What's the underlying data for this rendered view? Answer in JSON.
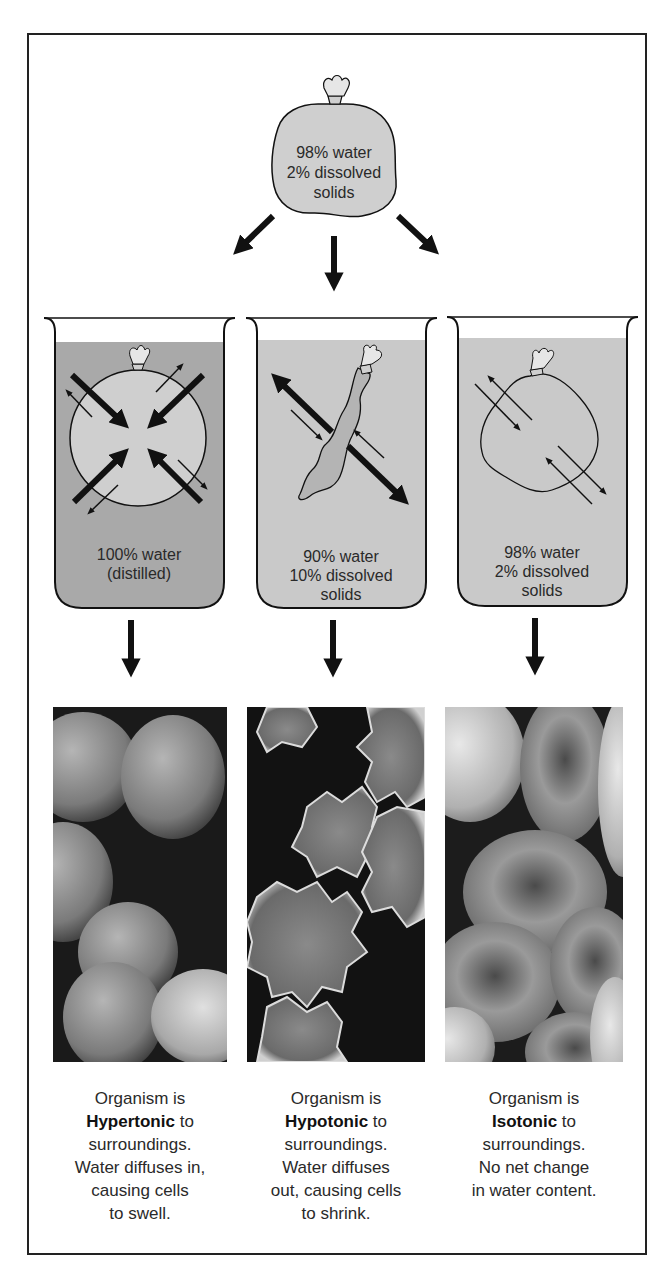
{
  "figure": {
    "source_bag": {
      "lines": [
        "98% water",
        "2% dissolved",
        "solids"
      ]
    },
    "beakers": [
      {
        "id": "hypertonic",
        "lines": [
          "100% water",
          "(distilled)"
        ],
        "fluid_color": "#a9a9a9",
        "bag_shape": "swollen-round"
      },
      {
        "id": "hypotonic",
        "lines": [
          "90% water",
          "10% dissolved",
          "solids"
        ],
        "fluid_color": "#c9c9c9",
        "bag_shape": "shrunken"
      },
      {
        "id": "isotonic",
        "lines": [
          "98% water",
          "2% dissolved",
          "solids"
        ],
        "fluid_color": "#c9c9c9",
        "bag_shape": "normal"
      }
    ],
    "photos": [
      {
        "subject": "swollen red blood cells (SEM)"
      },
      {
        "subject": "crenated shrunken red blood cells (SEM)"
      },
      {
        "subject": "normal biconcave red blood cells (SEM)"
      }
    ],
    "captions": [
      {
        "line1": "Organism is",
        "term": "Hypertonic",
        "after_term": " to",
        "rest": [
          "surroundings.",
          "Water diffuses in,",
          "causing cells",
          "to swell."
        ]
      },
      {
        "line1": "Organism is",
        "term": "Hypotonic",
        "after_term": " to",
        "rest": [
          "surroundings.",
          "Water diffuses",
          "out, causing cells",
          "to shrink."
        ]
      },
      {
        "line1": "Organism is",
        "term": "Isotonic",
        "after_term": " to",
        "rest": [
          "surroundings.",
          "No net change",
          "in water content."
        ]
      }
    ],
    "colors": {
      "line": "#111111",
      "bag_fill": "#cfcfcf",
      "fluid_dark": "#a9a9a9",
      "fluid_light": "#c9c9c9"
    }
  }
}
